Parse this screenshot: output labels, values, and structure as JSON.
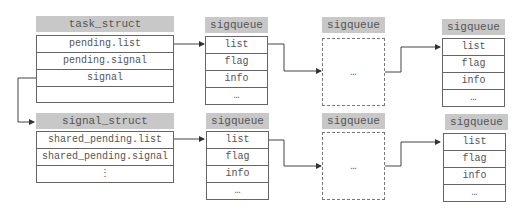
{
  "task_struct": {
    "title": "task_struct",
    "fields": [
      "pending.list",
      "pending.signal",
      "signal",
      ""
    ]
  },
  "signal_struct": {
    "title": "signal_struct",
    "fields": [
      "shared_pending.list",
      "shared_pending.signal",
      "⋮"
    ]
  },
  "top_queue": [
    {
      "title": "sigqueue",
      "fields": [
        "list",
        "flag",
        "info",
        "…"
      ]
    },
    {
      "title": "sigqueue",
      "placeholder": "…"
    },
    {
      "title": "sigqueue",
      "fields": [
        "list",
        "flag",
        "info",
        "…"
      ]
    }
  ],
  "bottom_queue": [
    {
      "title": "sigqueue",
      "fields": [
        "list",
        "flag",
        "info",
        "…"
      ]
    },
    {
      "title": "sigqueue",
      "placeholder": "…"
    },
    {
      "title": "sigqueue",
      "fields": [
        "list",
        "flag",
        "info",
        "…"
      ]
    }
  ]
}
